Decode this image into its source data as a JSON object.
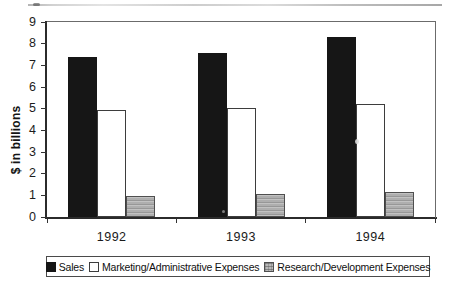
{
  "chart_data": {
    "type": "bar",
    "title": "",
    "ylabel": "$ in billions",
    "xlabel": "",
    "ylim": [
      0,
      9
    ],
    "yticks": [
      0,
      1,
      2,
      3,
      4,
      5,
      6,
      7,
      8,
      9
    ],
    "categories": [
      "1992",
      "1993",
      "1994"
    ],
    "series": [
      {
        "key": "sales",
        "name": "Sales",
        "pattern": "solid",
        "color": "#161616",
        "values": [
          7.4,
          7.55,
          8.3
        ]
      },
      {
        "key": "marketing-admin",
        "name": "Marketing/Administrative Expenses",
        "pattern": "outline",
        "color": "#ffffff",
        "values": [
          4.95,
          5.05,
          5.2
        ]
      },
      {
        "key": "research-dev",
        "name": "Research/Development Expenses",
        "pattern": "hstripes",
        "color": "#b4b4b4",
        "values": [
          0.95,
          1.05,
          1.15
        ]
      }
    ],
    "legend_position": "bottom",
    "grid": false
  }
}
